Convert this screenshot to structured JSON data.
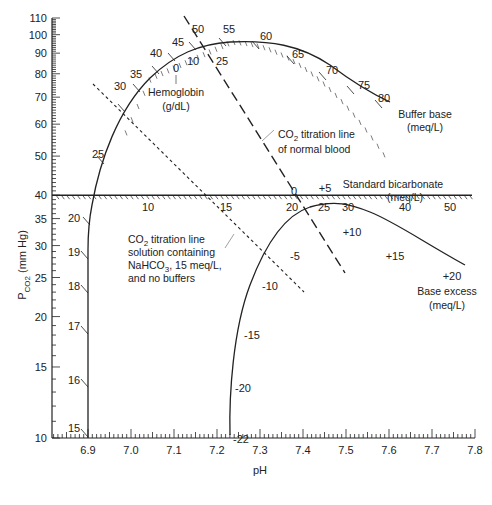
{
  "chart_data": {
    "type": "line",
    "xlabel": "pH",
    "ylabel": "PCO2 (mm Hg)",
    "ylabel_main": "P",
    "ylabel_sub": "CO2",
    "ylabel_tail": " (mm Hg)",
    "xlim": [
      6.8,
      7.8
    ],
    "ylim": [
      10,
      110
    ],
    "yscale": "log",
    "grid": false,
    "x_ticks": [
      "6.9",
      "7.0",
      "7.1",
      "7.2",
      "7.3",
      "7.4",
      "7.5",
      "7.6",
      "7.7",
      "7.8"
    ],
    "y_ticks": [
      "10",
      "15",
      "20",
      "25",
      "30",
      "35",
      "40",
      "50",
      "60",
      "70",
      "80",
      "90",
      "100",
      "110"
    ],
    "scales": {
      "pco2_40_line": {
        "label": "Standard bicarbonate",
        "unit": "(meq/L)",
        "ticks": [
          "10",
          "15",
          "20",
          "25",
          "30",
          "40",
          "50"
        ]
      },
      "buffer_base": {
        "label": "Buffer base",
        "unit": "(meq/L)",
        "ticks": [
          "15",
          "16",
          "17",
          "18",
          "19",
          "20",
          "25",
          "30",
          "35",
          "40",
          "45",
          "50",
          "55",
          "60",
          "65",
          "70",
          "75",
          "80"
        ]
      },
      "hemoglobin": {
        "label": "Hemoglobin",
        "unit": "(g/dL)",
        "ticks": [
          "0",
          "10",
          "25"
        ]
      },
      "base_excess": {
        "label": "Base excess",
        "unit": "(meq/L)",
        "ticks": [
          "-22",
          "-20",
          "-15",
          "-10",
          "-5",
          "0",
          "+5",
          "+10",
          "+15",
          "+20"
        ]
      }
    },
    "series": [
      {
        "name": "CO2 titration line of normal blood",
        "style": "long-dash",
        "points": [
          {
            "x": 7.12,
            "y": 105
          },
          {
            "x": 7.52,
            "y": 27
          }
        ]
      },
      {
        "name": "CO2 titration line solution containing NaHCO3, 15 meq/L, and no buffers",
        "style": "short-dash",
        "points": [
          {
            "x": 6.93,
            "y": 77
          },
          {
            "x": 7.43,
            "y": 25
          }
        ]
      }
    ],
    "annotations": [
      {
        "text_lines": [
          "CO2 titration line",
          "of normal blood"
        ]
      },
      {
        "text_lines": [
          "CO2 titration line",
          "solution containing",
          "NaHCO3, 15 meq/L,",
          "and no buffers"
        ]
      }
    ]
  }
}
